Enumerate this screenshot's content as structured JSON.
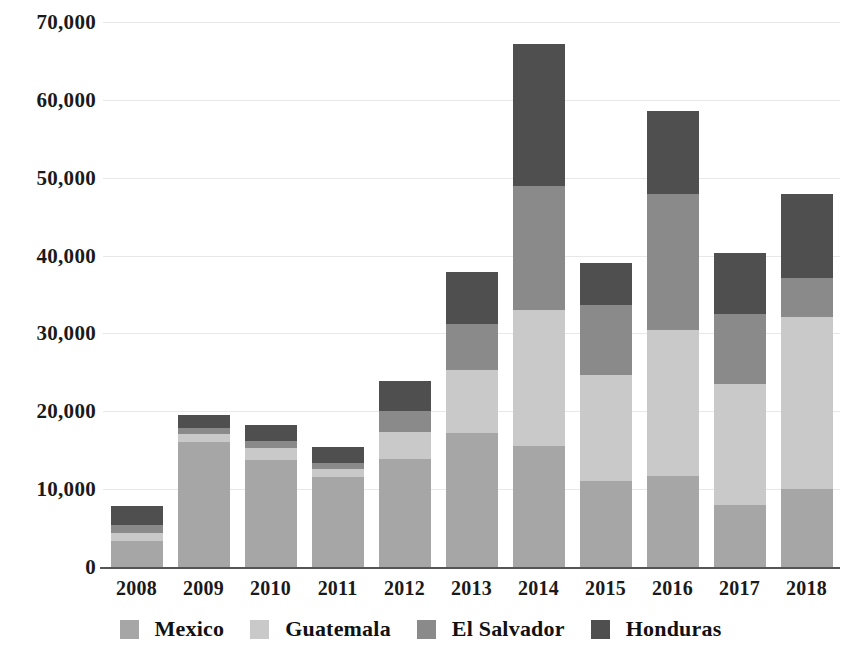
{
  "chart_data": {
    "type": "bar",
    "stacked": true,
    "title": "",
    "subtitle": "",
    "xlabel": "",
    "ylabel": "",
    "categories": [
      "2008",
      "2009",
      "2010",
      "2011",
      "2012",
      "2013",
      "2014",
      "2015",
      "2016",
      "2017",
      "2018"
    ],
    "series": [
      {
        "name": "Mexico",
        "color": "#a6a6a6",
        "values": [
          3300,
          16100,
          13700,
          11600,
          13900,
          17200,
          15600,
          11000,
          11700,
          8000,
          10000
        ]
      },
      {
        "name": "Guatemala",
        "color": "#c9c9c9",
        "values": [
          1100,
          1000,
          1600,
          1000,
          3500,
          8100,
          17400,
          13700,
          18700,
          15500,
          22100
        ]
      },
      {
        "name": "El Salvador",
        "color": "#8a8a8a",
        "values": [
          1000,
          700,
          900,
          700,
          2700,
          5900,
          16000,
          9000,
          17500,
          9000,
          5000
        ]
      },
      {
        "name": "Honduras",
        "color": "#4f4f4f",
        "values": [
          2400,
          1700,
          2000,
          2100,
          3800,
          6700,
          18200,
          5400,
          10700,
          7800,
          10800
        ]
      }
    ],
    "ylim": [
      0,
      70000
    ],
    "yticks": [
      0,
      10000,
      20000,
      30000,
      40000,
      50000,
      60000,
      70000
    ],
    "ytick_labels": [
      "0",
      "10,000",
      "20,000",
      "30,000",
      "40,000",
      "50,000",
      "60,000",
      "70,000"
    ],
    "grid": true,
    "grid_axis": "y",
    "legend_position": "bottom",
    "totals": [
      7800,
      19500,
      18200,
      15400,
      23900,
      37900,
      67200,
      39100,
      58600,
      40300,
      47900
    ]
  },
  "axis": {
    "y_tick_labels": [
      "70,000",
      "60,000",
      "50,000",
      "40,000",
      "30,000",
      "20,000",
      "10,000",
      "0"
    ],
    "x_tick_labels": [
      "2008",
      "2009",
      "2010",
      "2011",
      "2012",
      "2013",
      "2014",
      "2015",
      "2016",
      "2017",
      "2018"
    ]
  },
  "legend": {
    "items": [
      {
        "label": "Mexico",
        "color": "#a6a6a6"
      },
      {
        "label": "Guatemala",
        "color": "#c9c9c9"
      },
      {
        "label": "El Salvador",
        "color": "#8a8a8a"
      },
      {
        "label": "Honduras",
        "color": "#4f4f4f"
      }
    ]
  },
  "colors": {
    "axis": "#555555",
    "grid": "#e8e8e8",
    "text": "#1a1a1a",
    "background": "#ffffff"
  }
}
